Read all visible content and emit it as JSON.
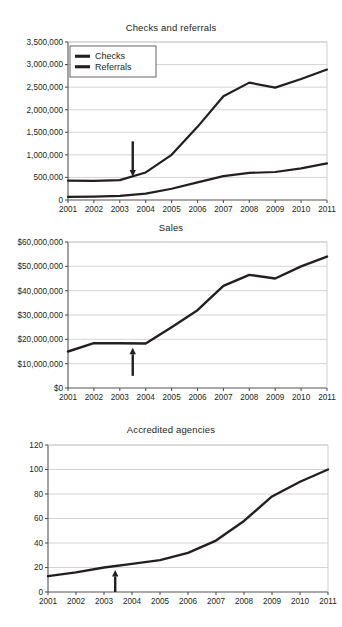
{
  "figure": {
    "background": "#ffffff",
    "ink_color": "#231f20",
    "grid_color": "#c9c9c9",
    "axis_color": "#555555"
  },
  "chart_data": [
    {
      "type": "line",
      "title": "Checks and referrals",
      "xlabel": "",
      "ylabel": "",
      "x": [
        2001,
        2002,
        2003,
        2004,
        2005,
        2006,
        2007,
        2008,
        2009,
        2010,
        2011
      ],
      "xtick_labels": [
        "2001",
        "2002",
        "2003",
        "2004",
        "2005",
        "2006",
        "2007",
        "2008",
        "2009",
        "2010",
        "2011"
      ],
      "ylim": [
        0,
        3500000
      ],
      "yticks": [
        0,
        500000,
        1000000,
        1500000,
        2000000,
        2500000,
        3000000,
        3500000
      ],
      "ytick_labels": [
        "0",
        "500,000",
        "1,000,000",
        "1,500,000",
        "2,000,000",
        "2,500,000",
        "3,000,000",
        "3,500,000"
      ],
      "grid": true,
      "legend_position": "upper-left",
      "series": [
        {
          "name": "Checks",
          "values": [
            430000,
            425000,
            440000,
            610000,
            1000000,
            1620000,
            2300000,
            2600000,
            2490000,
            2680000,
            2890000
          ]
        },
        {
          "name": "Referrals",
          "values": [
            70000,
            75000,
            90000,
            140000,
            250000,
            390000,
            530000,
            600000,
            620000,
            700000,
            810000
          ]
        }
      ],
      "annotations": [
        {
          "type": "arrow",
          "direction": "down",
          "x": 2003.5,
          "y_tail": 1300000,
          "y_head": 520000
        }
      ]
    },
    {
      "type": "line",
      "title": "Sales",
      "xlabel": "",
      "ylabel": "",
      "x": [
        2001,
        2002,
        2003,
        2004,
        2005,
        2006,
        2007,
        2008,
        2009,
        2010,
        2011
      ],
      "xtick_labels": [
        "2001",
        "2002",
        "2003",
        "2004",
        "2005",
        "2006",
        "2007",
        "2008",
        "2009",
        "2010",
        "2011"
      ],
      "ylim": [
        0,
        60000000
      ],
      "yticks": [
        0,
        10000000,
        20000000,
        30000000,
        40000000,
        50000000,
        60000000
      ],
      "ytick_labels": [
        "$0",
        "$10,000,000",
        "$20,000,000",
        "$30,000,000",
        "$40,000,000",
        "$50,000,000",
        "$60,000,000"
      ],
      "grid": true,
      "series": [
        {
          "name": "Sales",
          "values": [
            15000000,
            18400000,
            18400000,
            18300000,
            25000000,
            32000000,
            42000000,
            46500000,
            45000000,
            50000000,
            54000000
          ]
        }
      ],
      "annotations": [
        {
          "type": "arrow",
          "direction": "up",
          "x": 2003.5,
          "y_tail": 5000000,
          "y_head": 16500000
        }
      ]
    },
    {
      "type": "line",
      "title": "Accredited agencies",
      "xlabel": "",
      "ylabel": "",
      "x": [
        2001,
        2002,
        2003,
        2004,
        2005,
        2006,
        2007,
        2008,
        2009,
        2010,
        2011
      ],
      "xtick_labels": [
        "2001",
        "2002",
        "2003",
        "2004",
        "2005",
        "2006",
        "2007",
        "2008",
        "2009",
        "2010",
        "2011"
      ],
      "ylim": [
        0,
        120
      ],
      "yticks": [
        0,
        20,
        40,
        60,
        80,
        100,
        120
      ],
      "ytick_labels": [
        "0",
        "20",
        "40",
        "60",
        "80",
        "100",
        "120"
      ],
      "grid": true,
      "series": [
        {
          "name": "Accredited agencies",
          "values": [
            13,
            16,
            20,
            23,
            26,
            32,
            42,
            58,
            78,
            90,
            100
          ]
        }
      ],
      "annotations": [
        {
          "type": "arrow",
          "direction": "up",
          "x": 2003.4,
          "y_tail": 0,
          "y_head": 18
        }
      ]
    }
  ]
}
